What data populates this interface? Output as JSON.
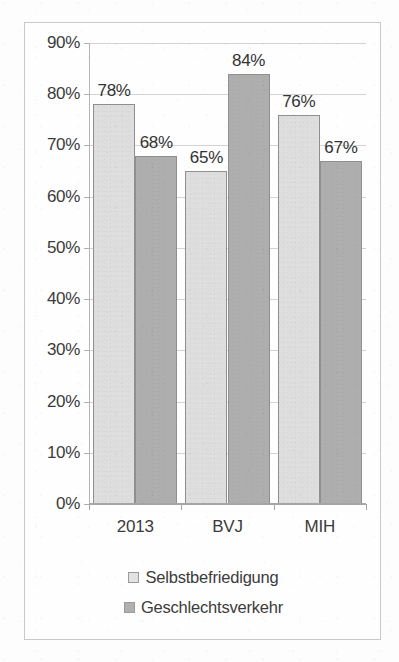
{
  "chart_data": {
    "type": "bar",
    "title": "",
    "subtitle": "",
    "xlabel": "",
    "ylabel": "",
    "categories": [
      "2013",
      "BVJ",
      "MIH"
    ],
    "series": [
      {
        "name": "Selbstbefriedigung",
        "color": "#dedede",
        "values": [
          78,
          65,
          76
        ],
        "labels": [
          "78%",
          "65%",
          "76%"
        ]
      },
      {
        "name": "Geschlechtsverkehr",
        "color": "#aeaeae",
        "values": [
          68,
          84,
          67
        ],
        "labels": [
          "68%",
          "84%",
          "67%"
        ]
      }
    ],
    "ylim": [
      0,
      90
    ],
    "ytick_values": [
      0,
      10,
      20,
      30,
      40,
      50,
      60,
      70,
      80,
      90
    ],
    "ytick_labels": [
      "0%",
      "10%",
      "20%",
      "30%",
      "40%",
      "50%",
      "60%",
      "70%",
      "80%",
      "90%"
    ],
    "grid": "horizontal",
    "legend_position": "bottom",
    "value_labels_shown": true
  },
  "legend": {
    "items": [
      {
        "label": "Selbstbefriedigung",
        "swatch": "legend-swatch-light"
      },
      {
        "label": "Geschlechtsverkehr",
        "swatch": "legend-swatch-dark"
      }
    ]
  },
  "colors": {
    "series_light": "#dedede",
    "series_dark": "#aeaeae",
    "gridline": "#d3d3d3",
    "axis": "#a6a6a6",
    "frame": "#c9c9c9",
    "text": "#3b3b3b",
    "background": "#fefefe"
  }
}
